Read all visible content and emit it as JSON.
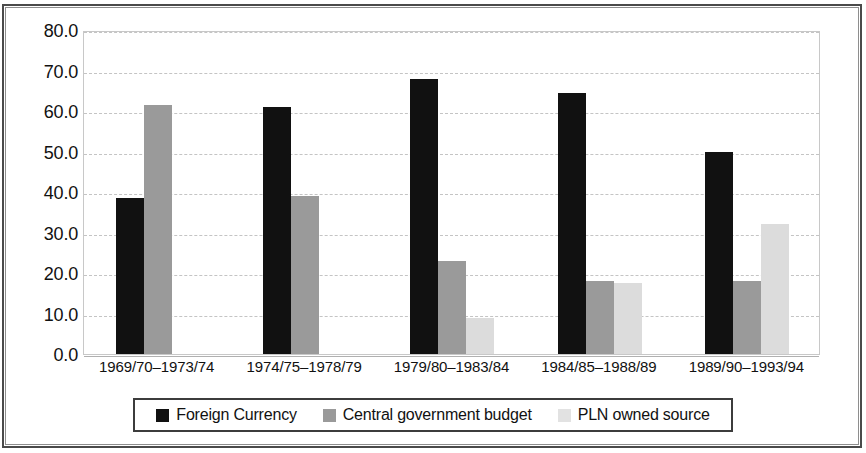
{
  "chart_data": {
    "type": "bar",
    "title": "",
    "subtitle": "",
    "xlabel": "",
    "ylabel": "",
    "ylim": [
      0.0,
      80.0
    ],
    "ytick_step": 10.0,
    "ytick_labels": [
      "80.0",
      "70.0",
      "60.0",
      "50.0",
      "40.0",
      "30.0",
      "20.0",
      "10.0",
      "0.0"
    ],
    "ytick_values": [
      80.0,
      70.0,
      60.0,
      50.0,
      40.0,
      30.0,
      20.0,
      10.0,
      0.0
    ],
    "grid": true,
    "grid_axis": "y",
    "legend_position": "bottom",
    "categories": [
      "1969/70–1973/74",
      "1974/75–1978/79",
      "1979/80–1983/84",
      "1984/85–1988/89",
      "1989/90–1993/94"
    ],
    "series": [
      {
        "name": "Foreign Currency",
        "color": "#111111",
        "values": [
          38.5,
          61.0,
          68.0,
          64.5,
          50.0
        ]
      },
      {
        "name": "Central government budget",
        "color": "#9a9a9a",
        "values": [
          61.5,
          39.0,
          23.0,
          18.0,
          18.0
        ]
      },
      {
        "name": "PLN owned source",
        "color": "#dcdcdc",
        "values": [
          0,
          0,
          9.0,
          17.5,
          32.0
        ]
      }
    ]
  }
}
